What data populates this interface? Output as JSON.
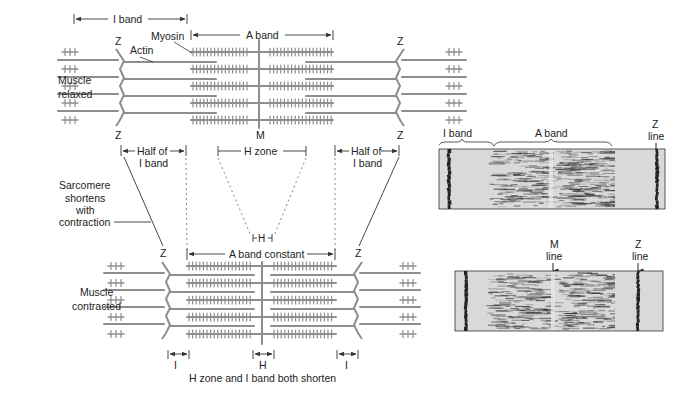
{
  "colors": {
    "filament": "#8e8e8e",
    "text": "#222222",
    "dim_line": "#333333",
    "micrograph_bg": "#d9d9d9",
    "micrograph_dark": "#222222"
  },
  "relaxed": {
    "side_label_line1": "Muscle",
    "side_label_line2": "relaxed",
    "i_band_label": "I band",
    "a_band_label": "A band",
    "myosin_label": "Myosin",
    "actin_label": "Actin",
    "z_label": "Z",
    "m_label": "M",
    "half_i_band_left_line1": "Half of",
    "half_i_band_left_line2": "I band",
    "half_i_band_right_line1": "Half of",
    "half_i_band_right_line2": "I band",
    "h_zone_label": "H zone"
  },
  "transition": {
    "sarcomere_line1": "Sarcomere",
    "sarcomere_line2": "shortens",
    "sarcomere_line3": "with",
    "sarcomere_line4": "contraction",
    "h_small_label": "H"
  },
  "contracted": {
    "side_label_line1": "Muscle",
    "side_label_line2": "contracted",
    "a_band_constant_label": "A band constant",
    "z_label": "Z",
    "i_left_label": "I",
    "h_label": "H",
    "i_right_label": "I",
    "caption": "H zone and I band both shorten"
  },
  "micrograph_relaxed": {
    "i_band_label": "I band",
    "a_band_label": "A band",
    "z_line_label_line1": "Z",
    "z_line_label_line2": "line"
  },
  "micrograph_contracted": {
    "m_line_label_line1": "M",
    "m_line_label_line2": "line",
    "z_line_label_line1": "Z",
    "z_line_label_line2": "line"
  }
}
